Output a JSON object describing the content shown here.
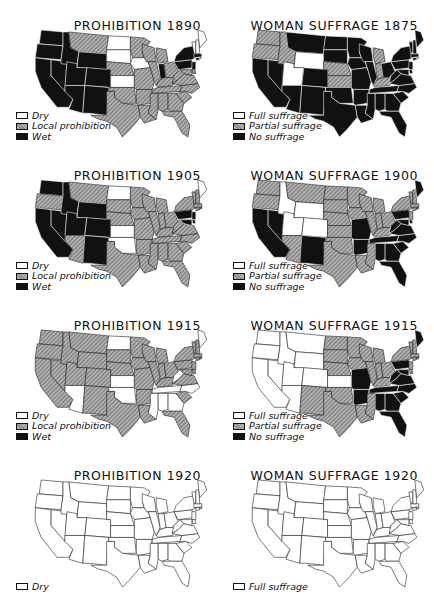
{
  "figure": {
    "colors": {
      "white": "#ffffff",
      "hatch": "#9a9a9a",
      "black": "#111111",
      "outline": "#222222"
    }
  },
  "panels": [
    {
      "id": "prohibition-1890",
      "title": "PROHIBITION 1890",
      "legend": [
        {
          "swatch": "white",
          "label": "Dry"
        },
        {
          "swatch": "hatch",
          "label": "Local prohibition"
        },
        {
          "swatch": "black",
          "label": "Wet"
        }
      ],
      "states": {
        "white": [
          "ND",
          "SD",
          "IA",
          "KS",
          "ME",
          "VT",
          "NH"
        ],
        "black": [
          "WA",
          "OR",
          "CA",
          "NV",
          "ID",
          "MT_W",
          "WY",
          "UT",
          "CO",
          "AZ",
          "NM",
          "OK_PAN",
          "IN",
          "NY",
          "PA",
          "NJ",
          "CT",
          "RI",
          "MA"
        ],
        "hatch": [
          "MT",
          "MN",
          "WI",
          "MI",
          "NE",
          "MO",
          "IL",
          "OH",
          "KY",
          "TN",
          "AR",
          "LA",
          "MS",
          "AL",
          "GA",
          "FL",
          "SC",
          "NC",
          "VA",
          "WV",
          "TX",
          "OK",
          "MD",
          "DE"
        ]
      }
    },
    {
      "id": "woman-suffrage-1875",
      "title": "WOMAN SUFFRAGE 1875",
      "legend": [
        {
          "swatch": "white",
          "label": "Full suffrage"
        },
        {
          "swatch": "hatch",
          "label": "Partial suffrage"
        },
        {
          "swatch": "black",
          "label": "No suffrage"
        }
      ],
      "states": {
        "white": [
          "WY",
          "UT"
        ],
        "hatch": [
          "WA",
          "OR",
          "ID",
          "NE",
          "KS",
          "MI",
          "IN",
          "KY"
        ],
        "black": [
          "CA",
          "NV",
          "MT",
          "ND",
          "SD",
          "MN",
          "WI",
          "IA",
          "MO",
          "IL",
          "OH",
          "CO",
          "AZ",
          "NM",
          "OK",
          "TX",
          "AR",
          "LA",
          "MS",
          "AL",
          "TN",
          "GA",
          "FL",
          "SC",
          "NC",
          "VA",
          "WV",
          "PA",
          "NY",
          "NJ",
          "DE",
          "MD",
          "CT",
          "RI",
          "MA",
          "VT",
          "NH",
          "ME"
        ]
      }
    },
    {
      "id": "prohibition-1905",
      "title": "PROHIBITION 1905",
      "legend": [
        {
          "swatch": "white",
          "label": "Dry"
        },
        {
          "swatch": "hatch",
          "label": "Local prohibition"
        },
        {
          "swatch": "black",
          "label": "Wet"
        }
      ],
      "states": {
        "white": [
          "ND",
          "KS",
          "ME",
          "OK_E"
        ],
        "black": [
          "WA",
          "CA",
          "NV",
          "ID",
          "WY",
          "UT",
          "CO",
          "NM",
          "OK_PAN",
          "PA",
          "NJ",
          "MD",
          "DE"
        ],
        "hatch": [
          "OR",
          "MT",
          "SD",
          "MN",
          "WI",
          "MI",
          "NE",
          "IA",
          "MO",
          "IL",
          "IN",
          "OH",
          "KY",
          "TN",
          "AR",
          "LA",
          "MS",
          "AL",
          "GA",
          "FL",
          "SC",
          "NC",
          "VA",
          "WV",
          "TX",
          "AZ",
          "NY",
          "CT",
          "RI",
          "MA",
          "VT",
          "NH"
        ]
      }
    },
    {
      "id": "woman-suffrage-1900",
      "title": "WOMAN SUFFRAGE 1900",
      "legend": [
        {
          "swatch": "white",
          "label": "Full suffrage"
        },
        {
          "swatch": "hatch",
          "label": "Partial suffrage"
        },
        {
          "swatch": "black",
          "label": "No suffrage"
        }
      ],
      "states": {
        "white": [
          "ID",
          "WY",
          "UT",
          "CO"
        ],
        "black": [
          "CA",
          "NV",
          "NM",
          "MO",
          "AR",
          "PA",
          "WV",
          "VA",
          "NC",
          "SC",
          "GA",
          "AL",
          "TN",
          "FL",
          "MD",
          "DE",
          "ME"
        ],
        "hatch": [
          "WA",
          "OR",
          "MT",
          "ND",
          "SD",
          "MN",
          "WI",
          "MI",
          "NE",
          "KS",
          "IA",
          "IL",
          "IN",
          "OH",
          "KY",
          "AZ",
          "OK",
          "TX",
          "LA",
          "MS",
          "NY",
          "NJ",
          "CT",
          "RI",
          "MA",
          "VT",
          "NH"
        ]
      }
    },
    {
      "id": "prohibition-1915",
      "title": "PROHIBITION 1915",
      "legend": [
        {
          "swatch": "white",
          "label": "Dry"
        },
        {
          "swatch": "hatch",
          "label": "Local prohibition"
        },
        {
          "swatch": "black",
          "label": "Wet"
        }
      ],
      "states": {
        "white": [
          "ND",
          "KS",
          "OK",
          "AZ",
          "WV",
          "TN",
          "NC",
          "MS",
          "AL",
          "GA",
          "ME"
        ],
        "black": [],
        "hatch": [
          "WA",
          "OR",
          "CA",
          "NV",
          "ID",
          "MT",
          "WY",
          "UT",
          "CO",
          "NM",
          "SD",
          "NE",
          "MN",
          "IA",
          "MO",
          "WI",
          "MI",
          "IL",
          "IN",
          "OH",
          "KY",
          "AR",
          "LA",
          "TX",
          "FL",
          "SC",
          "VA",
          "PA",
          "NY",
          "NJ",
          "DE",
          "MD",
          "CT",
          "RI",
          "MA",
          "VT",
          "NH"
        ]
      }
    },
    {
      "id": "woman-suffrage-1915",
      "title": "WOMAN SUFFRAGE 1915",
      "legend": [
        {
          "swatch": "white",
          "label": "Full suffrage"
        },
        {
          "swatch": "hatch",
          "label": "Partial suffrage"
        },
        {
          "swatch": "black",
          "label": "No suffrage"
        }
      ],
      "states": {
        "white": [
          "WA",
          "OR",
          "CA",
          "NV",
          "ID",
          "MT",
          "WY",
          "UT",
          "CO",
          "AZ",
          "KS"
        ],
        "black": [
          "MO",
          "AR",
          "TN",
          "AL",
          "GA",
          "FL",
          "SC",
          "NC",
          "VA",
          "WV",
          "PA",
          "MD",
          "ME"
        ],
        "hatch": [
          "ND",
          "SD",
          "NE",
          "MN",
          "IA",
          "WI",
          "MI",
          "IL",
          "IN",
          "OH",
          "KY",
          "NM",
          "OK",
          "TX",
          "LA",
          "MS",
          "NY",
          "NJ",
          "DE",
          "CT",
          "RI",
          "MA",
          "VT",
          "NH"
        ]
      }
    },
    {
      "id": "prohibition-1920",
      "title": "PROHIBITION 1920",
      "legend": [
        {
          "swatch": "white",
          "label": "Dry"
        }
      ],
      "states": {
        "white": [
          "ALL"
        ],
        "hatch": [],
        "black": []
      }
    },
    {
      "id": "woman-suffrage-1920",
      "title": "WOMAN SUFFRAGE 1920",
      "legend": [
        {
          "swatch": "white",
          "label": "Full suffrage"
        }
      ],
      "states": {
        "white": [
          "ALL"
        ],
        "hatch": [],
        "black": []
      }
    }
  ]
}
